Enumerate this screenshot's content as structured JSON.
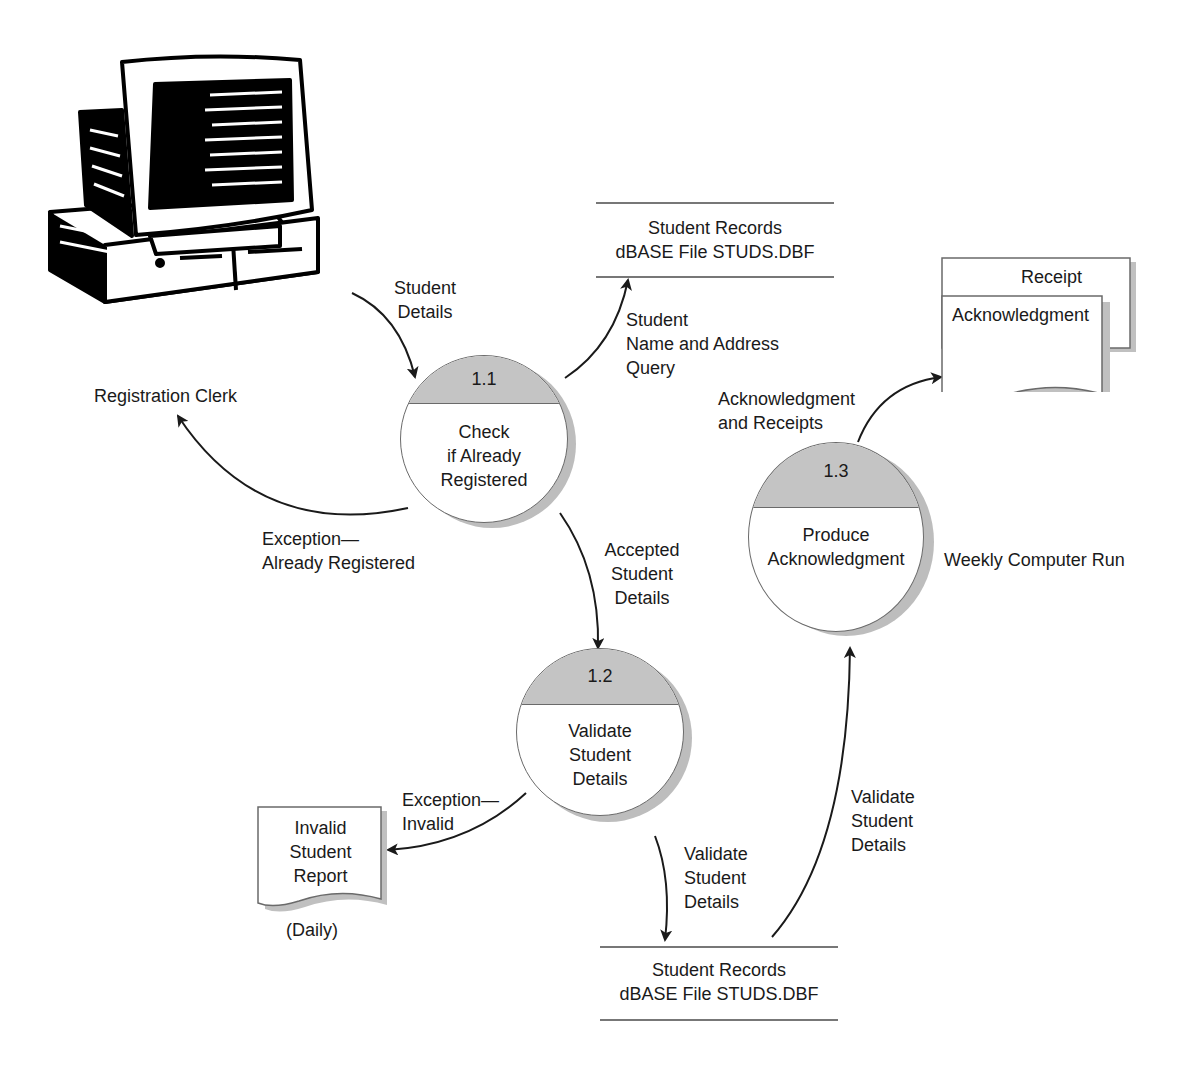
{
  "diagram": {
    "type": "data-flow-diagram",
    "external_entity": {
      "icon": "computer-icon",
      "label": "Registration Clerk"
    },
    "processes": [
      {
        "id": "1.1",
        "lines": [
          "Check",
          "if Already",
          "Registered"
        ]
      },
      {
        "id": "1.2",
        "lines": [
          "Validate",
          "Student",
          "Details"
        ]
      },
      {
        "id": "1.3",
        "lines": [
          "Produce",
          "Acknowledgment"
        ]
      }
    ],
    "data_stores": [
      {
        "lines": [
          "Student Records",
          "dBASE File STUDS.DBF"
        ]
      },
      {
        "lines": [
          "Student Records",
          "dBASE File STUDS.DBF"
        ]
      }
    ],
    "documents": {
      "receipt": "Receipt",
      "acknowledgment": "Acknowledgment",
      "invalid_report": [
        "Invalid",
        "Student",
        "Report"
      ],
      "invalid_report_frequency": "(Daily)"
    },
    "flows": {
      "student_details": [
        "Student",
        "Details"
      ],
      "name_address_query": [
        "Student",
        "Name and Address",
        "Query"
      ],
      "exception_registered": [
        "Exception—",
        "Already Registered"
      ],
      "accepted_details": [
        "Accepted",
        "Student",
        "Details"
      ],
      "exception_invalid": [
        "Exception—",
        "Invalid"
      ],
      "validate_to_store": [
        "Validate",
        "Student",
        "Details"
      ],
      "store_to_produce": [
        "Validate",
        "Student",
        "Details"
      ],
      "ack_receipts": [
        "Acknowledgment",
        "and Receipts"
      ]
    },
    "annotations": {
      "weekly_run": "Weekly Computer Run"
    },
    "colors": {
      "bubble_cap": "#c4c4c4",
      "outline": "#6a6a6a",
      "shadow": "#bdbdbd",
      "ink": "#1a1a1a"
    }
  }
}
